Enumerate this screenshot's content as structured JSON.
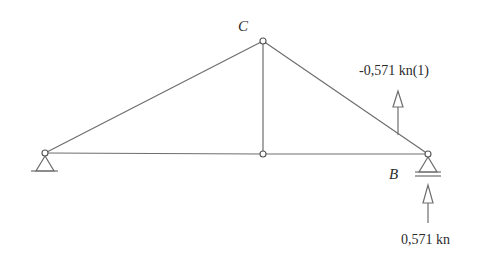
{
  "diagram": {
    "type": "truss-structure",
    "stroke_color": "#6e6e6e",
    "text_color": "#2b2b2b",
    "nodes": {
      "A": {
        "x": 45,
        "y": 153,
        "label": ""
      },
      "C": {
        "x": 263,
        "y": 41,
        "label": "C"
      },
      "M": {
        "x": 263,
        "y": 154,
        "label": ""
      },
      "B": {
        "x": 428,
        "y": 154,
        "label": "B"
      }
    },
    "members": [
      {
        "from": "A",
        "to": "C"
      },
      {
        "from": "C",
        "to": "B"
      },
      {
        "from": "C",
        "to": "M"
      },
      {
        "from": "A",
        "to": "M"
      },
      {
        "from": "M",
        "to": "B"
      }
    ],
    "supports": [
      {
        "node": "A",
        "type": "pin"
      },
      {
        "node": "B",
        "type": "roller"
      }
    ],
    "loads": [
      {
        "label": "-0,571 kn(1)",
        "direction": "up",
        "x": 398,
        "tip_y": 91,
        "base_y": 135
      },
      {
        "label": "0,571 kn",
        "direction": "up",
        "x": 428,
        "tip_y": 185,
        "base_y": 223
      }
    ]
  }
}
